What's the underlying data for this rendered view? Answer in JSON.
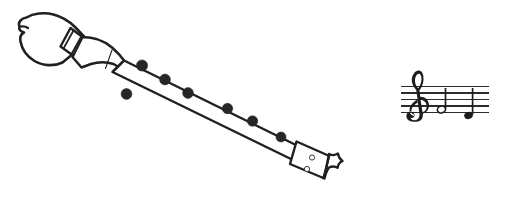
{
  "image": {
    "title": "Soprano recorder with treble-clef staff",
    "background_color": "#ffffff",
    "ink_color": "#231f20",
    "width": 520,
    "height": 205
  },
  "recorder": {
    "label": "recorder",
    "orientation": "diagonal, head upper-left to foot lower-right",
    "parts": [
      {
        "name": "head-joint",
        "label": "Head joint / mouthpiece"
      },
      {
        "name": "tenon-band",
        "label": "Decorative band"
      },
      {
        "name": "beak-window",
        "label": "Beak and window"
      },
      {
        "name": "body-joint",
        "label": "Body joint"
      },
      {
        "name": "foot-joint",
        "label": "Foot joint"
      }
    ],
    "finger_holes": {
      "label": "Finger holes",
      "dark_hole_count": 7,
      "open_hole_count": 2
    }
  },
  "staff": {
    "label": "Musical staff",
    "clef": "treble-clef",
    "clef_symbol": "𝄞",
    "line_count": 5,
    "notes": [
      {
        "name": "note-1",
        "type": "half-note",
        "head": "open"
      },
      {
        "name": "note-2",
        "type": "quarter-note",
        "head": "filled"
      }
    ],
    "note_color": "#1d1d1d",
    "line_color": "#2b2b2b"
  }
}
